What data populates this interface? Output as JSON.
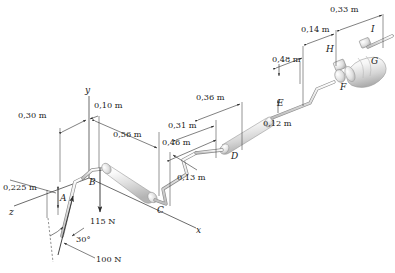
{
  "figure": {
    "background": "#ffffff",
    "axes": [
      {
        "name": "x-axis",
        "label": "x"
      },
      {
        "name": "y-axis",
        "label": "y"
      },
      {
        "name": "z-axis",
        "label": "z"
      }
    ],
    "points": [
      {
        "id": "A",
        "label": "A"
      },
      {
        "id": "B",
        "label": "B"
      },
      {
        "id": "C",
        "label": "C"
      },
      {
        "id": "D",
        "label": "D"
      },
      {
        "id": "E",
        "label": "E"
      },
      {
        "id": "F",
        "label": "F"
      },
      {
        "id": "G",
        "label": "G"
      },
      {
        "id": "H",
        "label": "H"
      },
      {
        "id": "I",
        "label": "I"
      }
    ],
    "dimensions": [
      {
        "id": "d-0225",
        "label": "0,225 m"
      },
      {
        "id": "d-030",
        "label": "0,30 m"
      },
      {
        "id": "d-010",
        "label": "0,10 m"
      },
      {
        "id": "d-056",
        "label": "0,56 m"
      },
      {
        "id": "d-046",
        "label": "0,46 m"
      },
      {
        "id": "d-031",
        "label": "0,31 m"
      },
      {
        "id": "d-013",
        "label": "0,13 m"
      },
      {
        "id": "d-036",
        "label": "0,36 m"
      },
      {
        "id": "d-048",
        "label": "0,48 m"
      },
      {
        "id": "d-014",
        "label": "0,14 m"
      },
      {
        "id": "d-033",
        "label": "0,33 m"
      },
      {
        "id": "d-012",
        "label": "0,12 m"
      }
    ],
    "forces": [
      {
        "id": "force-115",
        "label": "115 N",
        "direction": "down"
      },
      {
        "id": "force-100",
        "label": "100 N",
        "direction": "up-left-inclined"
      }
    ],
    "angles": [
      {
        "id": "angle-30",
        "label": "30°"
      }
    ],
    "colors": {
      "line": "#2b2b2b",
      "rod_outline": "#7d7d7d",
      "cylinder_light": "#fcfcfc",
      "cylinder_mid": "#d9d9d9",
      "cylinder_dark": "#a8a8a8",
      "text": "#1a1a1a"
    }
  }
}
